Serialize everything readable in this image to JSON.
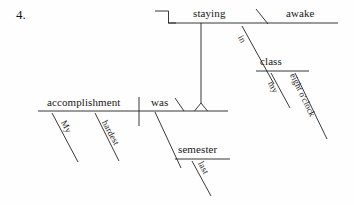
{
  "item": {
    "number": "4."
  },
  "diagram": {
    "type": "reed-kellogg-sentence-diagram",
    "sentence": "My hardest accomplishment last semester was staying awake in my eight o'clock class.",
    "ink_color": "#222222",
    "words": {
      "staying": "staying",
      "awake": "awake",
      "in": "in",
      "class": "class",
      "my_class": "my",
      "eight_oclock": "eight o'clock",
      "accomplishment": "accomplishment",
      "my_accomplishment": "My",
      "hardest": "hardest",
      "was": "was",
      "semester": "semester",
      "last": "last"
    }
  }
}
